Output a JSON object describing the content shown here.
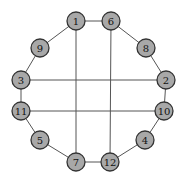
{
  "diagram": {
    "type": "graph",
    "node_radius": 9,
    "colors": {
      "node_fill": "#a8a8a8",
      "node_stroke": "#333333",
      "edge": "#555555",
      "background": "#ffffff"
    },
    "nodes": [
      {
        "id": "1",
        "label": "1",
        "x": 76,
        "y": 21
      },
      {
        "id": "6",
        "label": "6",
        "x": 111,
        "y": 21
      },
      {
        "id": "9",
        "label": "9",
        "x": 40,
        "y": 48
      },
      {
        "id": "8",
        "label": "8",
        "x": 146,
        "y": 48
      },
      {
        "id": "3",
        "label": "3",
        "x": 21,
        "y": 80
      },
      {
        "id": "2",
        "label": "2",
        "x": 166,
        "y": 80
      },
      {
        "id": "11",
        "label": "11",
        "x": 21,
        "y": 111
      },
      {
        "id": "10",
        "label": "10",
        "x": 164,
        "y": 111
      },
      {
        "id": "5",
        "label": "5",
        "x": 40,
        "y": 140
      },
      {
        "id": "4",
        "label": "4",
        "x": 145,
        "y": 140
      },
      {
        "id": "7",
        "label": "7",
        "x": 76,
        "y": 162
      },
      {
        "id": "12",
        "label": "12",
        "x": 110,
        "y": 162
      }
    ],
    "edges": [
      [
        "1",
        "6"
      ],
      [
        "1",
        "9"
      ],
      [
        "9",
        "3"
      ],
      [
        "6",
        "8"
      ],
      [
        "8",
        "2"
      ],
      [
        "3",
        "11"
      ],
      [
        "2",
        "10"
      ],
      [
        "11",
        "5"
      ],
      [
        "10",
        "4"
      ],
      [
        "5",
        "7"
      ],
      [
        "4",
        "12"
      ],
      [
        "7",
        "12"
      ],
      [
        "3",
        "2"
      ],
      [
        "11",
        "10"
      ],
      [
        "1",
        "7"
      ],
      [
        "6",
        "12"
      ]
    ]
  }
}
